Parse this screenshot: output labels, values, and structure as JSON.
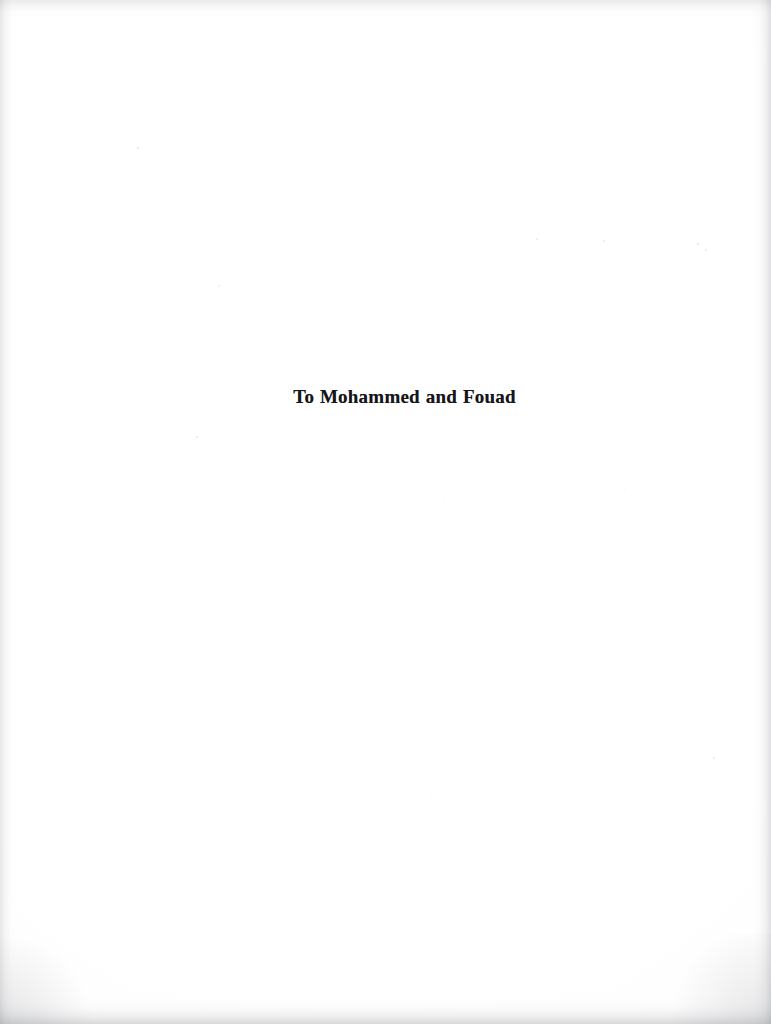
{
  "page": {
    "kind": "book-dedication-page",
    "width": 771,
    "height": 1024,
    "background_color": "#ffffff",
    "paper_tint": "#fdfdfd"
  },
  "dedication": {
    "text": "To Mohammed and Fouad",
    "text_color": "#15161a",
    "alignment": "center"
  },
  "scan_artifacts": {
    "edge_shadow_color": "#85878d",
    "speck_color": "#d9dadc",
    "specks": [
      {
        "x": 218,
        "y": 285,
        "size": 2.2
      },
      {
        "x": 137,
        "y": 147,
        "size": 1.6
      },
      {
        "x": 333,
        "y": 88,
        "size": 1.4
      },
      {
        "x": 536,
        "y": 238,
        "size": 1.8
      },
      {
        "x": 603,
        "y": 240,
        "size": 1.5
      },
      {
        "x": 697,
        "y": 243,
        "size": 1.7
      },
      {
        "x": 705,
        "y": 249,
        "size": 1.5
      },
      {
        "x": 713,
        "y": 757,
        "size": 1.9
      },
      {
        "x": 624,
        "y": 489,
        "size": 1.4
      },
      {
        "x": 443,
        "y": 497,
        "size": 1.3
      },
      {
        "x": 196,
        "y": 436,
        "size": 1.5
      },
      {
        "x": 230,
        "y": 629,
        "size": 1.4
      },
      {
        "x": 431,
        "y": 794,
        "size": 1.4
      },
      {
        "x": 538,
        "y": 563,
        "size": 1.3
      }
    ]
  }
}
